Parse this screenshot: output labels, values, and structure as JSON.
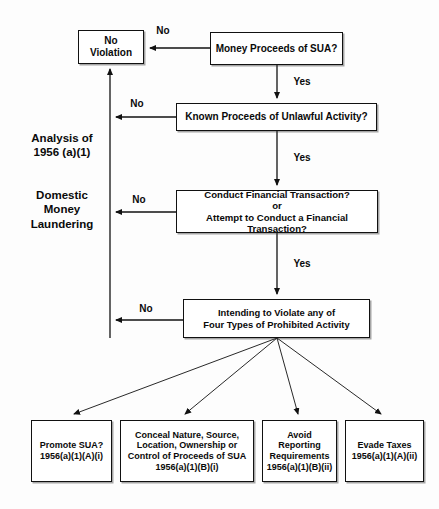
{
  "diagram": {
    "title": "Analysis of 1956 (a)(1) Domestic Money Laundering",
    "ink_color": "#0a0a0a",
    "background": "#fdfdfd",
    "side_labels": [
      {
        "id": "analysis",
        "text": "Analysis of\n1956 (a)(1)"
      },
      {
        "id": "domestic",
        "text": "Domestic\nMoney\nLaundering"
      }
    ],
    "nodes": {
      "no_violation": "No\nViolation",
      "money_proceeds": "Money Proceeds of SUA?",
      "known_proceeds": "Known Proceeds of Unlawful Activity?",
      "conduct_txn": "Conduct Financial Transaction?\nor\nAttempt to Conduct a Financial Transaction?",
      "intending": "Intending to Violate any of\nFour Types of Prohibited Activity"
    },
    "outcomes": [
      {
        "id": "promote-sua",
        "text": "Promote SUA?\n1956(a)(1)(A)(i)"
      },
      {
        "id": "conceal-nature",
        "text": "Conceal Nature, Source,\nLocation, Ownership or\nControl of Proceeds of SUA\n1956(a)(1)(B)(i)"
      },
      {
        "id": "avoid-reporting",
        "text": "Avoid\nReporting\nRequirements\n1956(a)(1)(B)(ii)"
      },
      {
        "id": "evade-taxes",
        "text": "Evade Taxes\n1956(a)(1)(A)(ii)"
      }
    ],
    "edge_labels": {
      "no_1": "No",
      "no_2": "No",
      "no_3": "No",
      "no_4": "No",
      "yes_1": "Yes",
      "yes_2": "Yes",
      "yes_3": "Yes"
    }
  }
}
